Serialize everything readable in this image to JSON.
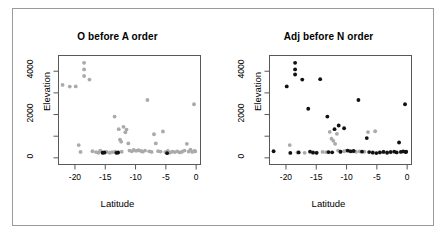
{
  "figure": {
    "background": "#ffffff",
    "frame_color": "#9a9a9a",
    "axis_color": "#585858"
  },
  "chart_data": [
    {
      "type": "scatter",
      "title": "O before A order",
      "xlabel": "Latitude",
      "ylabel": "Elevation",
      "xlim": [
        -22.8,
        0.8
      ],
      "ylim": [
        -330,
        4750
      ],
      "xticks": [
        -20,
        -15,
        -10,
        -5,
        0
      ],
      "yticks": [
        0,
        2000,
        4000
      ],
      "yminorticks": [
        1000,
        3000
      ],
      "grid": false,
      "legend": "none",
      "series": [
        {
          "name": "grey-points",
          "color": "#aaaaaa",
          "marker": "circle",
          "points": [
            [
              -22.2,
              3390
            ],
            [
              -21.0,
              3310
            ],
            [
              -20.0,
              3320
            ],
            [
              -19.5,
              560
            ],
            [
              -19.2,
              240
            ],
            [
              -18.6,
              4430
            ],
            [
              -18.6,
              4120
            ],
            [
              -18.6,
              3810
            ],
            [
              -17.7,
              3640
            ],
            [
              -17.2,
              270
            ],
            [
              -16.6,
              230
            ],
            [
              -16.2,
              200
            ],
            [
              -15.9,
              300
            ],
            [
              -15.5,
              215
            ],
            [
              -15.2,
              190
            ],
            [
              -14.8,
              240
            ],
            [
              -14.3,
              200
            ],
            [
              -13.9,
              225
            ],
            [
              -13.5,
              1900
            ],
            [
              -13.4,
              250
            ],
            [
              -13.0,
              195
            ],
            [
              -12.8,
              1310
            ],
            [
              -12.6,
              820
            ],
            [
              -12.4,
              720
            ],
            [
              -12.3,
              245
            ],
            [
              -12.0,
              1420
            ],
            [
              -11.7,
              1160
            ],
            [
              -11.5,
              1290
            ],
            [
              -11.2,
              640
            ],
            [
              -11.0,
              300
            ],
            [
              -10.6,
              265
            ],
            [
              -10.3,
              330
            ],
            [
              -9.9,
              290
            ],
            [
              -9.5,
              315
            ],
            [
              -9.1,
              280
            ],
            [
              -8.8,
              250
            ],
            [
              -8.4,
              300
            ],
            [
              -8.0,
              2680
            ],
            [
              -7.7,
              265
            ],
            [
              -7.3,
              240
            ],
            [
              -6.9,
              1070
            ],
            [
              -6.6,
              640
            ],
            [
              -6.2,
              275
            ],
            [
              -5.8,
              255
            ],
            [
              -5.4,
              1200
            ],
            [
              -5.0,
              230
            ],
            [
              -4.6,
              290
            ],
            [
              -4.2,
              210
            ],
            [
              -3.8,
              250
            ],
            [
              -3.4,
              230
            ],
            [
              -3.0,
              265
            ],
            [
              -2.6,
              215
            ],
            [
              -2.2,
              245
            ],
            [
              -1.8,
              300
            ],
            [
              -1.4,
              620
            ],
            [
              -1.1,
              255
            ],
            [
              -0.8,
              350
            ],
            [
              -0.5,
              240
            ],
            [
              -0.2,
              2480
            ],
            [
              -0.1,
              285
            ],
            [
              0.0,
              260
            ]
          ]
        },
        {
          "name": "black-points",
          "color": "#111111",
          "marker": "circle",
          "points": [
            [
              -15.5,
              200
            ],
            [
              -15.2,
              215
            ],
            [
              -13.2,
              195
            ],
            [
              -12.9,
              210
            ],
            [
              -4.7,
              180
            ]
          ]
        }
      ]
    },
    {
      "type": "scatter",
      "title": "Adj before N order",
      "xlabel": "Latitude",
      "ylabel": "Elevation",
      "xlim": [
        -22.8,
        0.8
      ],
      "ylim": [
        -330,
        4750
      ],
      "xticks": [
        -20,
        -15,
        -10,
        -5,
        0
      ],
      "yticks": [
        0,
        2000,
        4000
      ],
      "yminorticks": [
        1000,
        3000
      ],
      "grid": false,
      "legend": "none",
      "series": [
        {
          "name": "grey-points",
          "color": "#aaaaaa",
          "marker": "circle",
          "points": [
            [
              -19.5,
              560
            ],
            [
              -18.2,
              210
            ],
            [
              -17.0,
              195
            ],
            [
              -15.6,
              230
            ],
            [
              -15.0,
              200
            ],
            [
              -14.0,
              240
            ],
            [
              -13.4,
              225
            ],
            [
              -12.8,
              1180
            ],
            [
              -12.5,
              860
            ],
            [
              -12.2,
              760
            ],
            [
              -11.9,
              620
            ],
            [
              -11.6,
              1090
            ],
            [
              -11.4,
              300
            ],
            [
              -11.0,
              250
            ],
            [
              -10.4,
              270
            ],
            [
              -10.0,
              300
            ],
            [
              -9.5,
              280
            ],
            [
              -9.0,
              260
            ],
            [
              -8.4,
              245
            ],
            [
              -7.8,
              265
            ],
            [
              -7.0,
              250
            ],
            [
              -6.4,
              1170
            ],
            [
              -5.2,
              1210
            ],
            [
              -5.6,
              230
            ],
            [
              -4.5,
              215
            ],
            [
              -3.8,
              245
            ],
            [
              -3.2,
              230
            ],
            [
              -2.6,
              250
            ]
          ]
        },
        {
          "name": "black-points",
          "color": "#111111",
          "marker": "circle",
          "points": [
            [
              -22.2,
              270
            ],
            [
              -20.0,
              3320
            ],
            [
              -18.6,
              4430
            ],
            [
              -18.6,
              4120
            ],
            [
              -18.6,
              3880
            ],
            [
              -17.4,
              3640
            ],
            [
              -19.4,
              190
            ],
            [
              -18.0,
              215
            ],
            [
              -16.4,
              2270
            ],
            [
              -16.1,
              250
            ],
            [
              -15.6,
              205
            ],
            [
              -15.0,
              195
            ],
            [
              -14.4,
              3660
            ],
            [
              -13.2,
              1900
            ],
            [
              -13.0,
              230
            ],
            [
              -12.4,
              220
            ],
            [
              -12.0,
              1310
            ],
            [
              -11.3,
              1480
            ],
            [
              -11.0,
              245
            ],
            [
              -10.4,
              1350
            ],
            [
              -9.8,
              300
            ],
            [
              -9.3,
              265
            ],
            [
              -8.8,
              280
            ],
            [
              -8.0,
              2680
            ],
            [
              -7.4,
              250
            ],
            [
              -6.6,
              890
            ],
            [
              -6.2,
              230
            ],
            [
              -5.6,
              205
            ],
            [
              -5.0,
              185
            ],
            [
              -4.4,
              215
            ],
            [
              -3.8,
              240
            ],
            [
              -3.2,
              200
            ],
            [
              -2.6,
              230
            ],
            [
              -2.0,
              250
            ],
            [
              -1.6,
              215
            ],
            [
              -1.2,
              680
            ],
            [
              -0.9,
              240
            ],
            [
              -0.5,
              260
            ],
            [
              -0.2,
              2480
            ],
            [
              -0.1,
              230
            ],
            [
              0.0,
              250
            ]
          ]
        }
      ]
    }
  ],
  "panels": [
    {
      "id": "left",
      "title": "O before A order",
      "xlabel": "Latitude",
      "ylabel": "Elevation",
      "xticks": [
        "-20",
        "-15",
        "-10",
        "-5",
        "0"
      ],
      "yticks": [
        "0",
        "2000",
        "4000"
      ]
    },
    {
      "id": "right",
      "title": "Adj before N order",
      "xlabel": "Latitude",
      "ylabel": "Elevation",
      "xticks": [
        "-20",
        "-15",
        "-10",
        "-5",
        "0"
      ],
      "yticks": [
        "0",
        "2000",
        "4000"
      ]
    }
  ]
}
